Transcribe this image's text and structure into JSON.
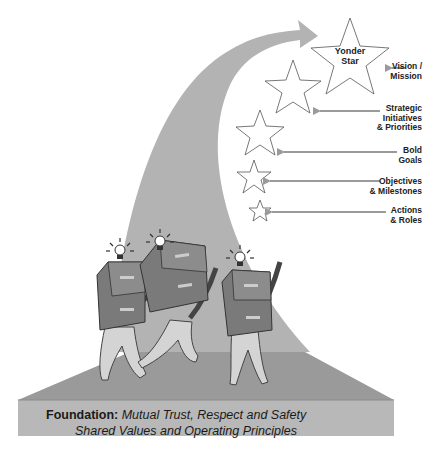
{
  "diagram": {
    "title": "Yonder Star",
    "colors": {
      "arrow_fill": "#b3b3b3",
      "platform_top": "#9a9a9a",
      "platform_front": "#b8b8b8",
      "platform_side": "#a8a8a8",
      "cabinet": "#7a7a7a",
      "figure": "#d4d4d4",
      "label_arrow": "#9a9a9a",
      "text": "#222222"
    },
    "stars": [
      {
        "id": "yonder-star",
        "label": "Yonder\nStar"
      },
      {
        "id": "star-strategic"
      },
      {
        "id": "star-bold"
      },
      {
        "id": "star-objectives"
      },
      {
        "id": "star-actions"
      }
    ],
    "levels": [
      {
        "id": "vision",
        "label": "Vision /\nMission"
      },
      {
        "id": "strategic",
        "label": "Strategic\nInitiatives\n& Priorities"
      },
      {
        "id": "bold",
        "label": "Bold\nGoals"
      },
      {
        "id": "objectives",
        "label": "Objectives\n& Milestones"
      },
      {
        "id": "actions",
        "label": "Actions\n& Roles"
      }
    ],
    "figures": [
      {
        "id": "figure-left",
        "carries": "filing-cabinet",
        "idea": "lightbulb"
      },
      {
        "id": "figure-middle",
        "carries": "filing-cabinet",
        "idea": "lightbulb"
      },
      {
        "id": "figure-right",
        "carries": "filing-cabinet",
        "idea": "lightbulb"
      }
    ],
    "foundation": {
      "label": "Foundation:",
      "line1": "Mutual Trust, Respect and Safety",
      "line2": "Shared Values and Operating Principles"
    }
  }
}
